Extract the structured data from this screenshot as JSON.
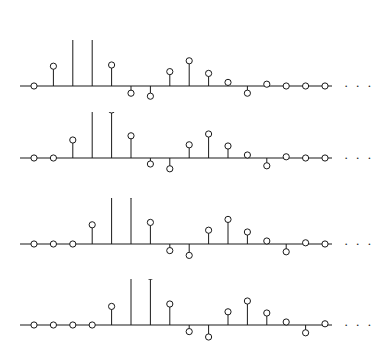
{
  "figure": {
    "title": "",
    "background_color": "#ffffff",
    "line_color": "#1a1a1a",
    "marker_fill": "#ffffff",
    "width": 375,
    "height": 361,
    "continuation_symbol": "· · ·"
  },
  "chart_data": {
    "type": "line",
    "subtype": "stem",
    "title": "",
    "xlabel": "",
    "ylabel": "",
    "grid": false,
    "legend": null,
    "axis": {
      "baseline_visible": true,
      "x_start_px": 20,
      "x_end_px": 332,
      "sample_spacing_px": 19.4,
      "first_sample_px": 34,
      "ticks_shown": false,
      "tick_labels": [],
      "y_tick_labels": []
    },
    "panel_layout": {
      "count": 4,
      "baselines_px": [
        86,
        158,
        244,
        325
      ],
      "unit_scale_px": 60,
      "annotation": "Four stacked stem (impulse) sequence plots, each continuing to the right with an ellipsis."
    },
    "panels": [
      {
        "name": "panel-1",
        "index": 0,
        "baseline_y_px": 86,
        "ellipsis_x_px": 344,
        "x": [
          0,
          1,
          2,
          3,
          4,
          5,
          6,
          7,
          8,
          9,
          10,
          11,
          12,
          13,
          14,
          15,
          16
        ],
        "values": [
          0.0,
          0.33,
          1.0,
          0.83,
          0.35,
          -0.12,
          -0.17,
          0.24,
          0.42,
          0.21,
          0.06,
          -0.12,
          0.03,
          0.0,
          0.0,
          0.0,
          0.0
        ]
      },
      {
        "name": "panel-2",
        "index": 1,
        "baseline_y_px": 158,
        "ellipsis_x_px": 344,
        "x": [
          0,
          1,
          2,
          3,
          4,
          5,
          6,
          7,
          8,
          9,
          10,
          11,
          12,
          13,
          14,
          15,
          16
        ],
        "values": [
          0.0,
          0.0,
          0.3,
          0.98,
          0.8,
          0.37,
          -0.1,
          -0.18,
          0.22,
          0.4,
          0.2,
          0.05,
          -0.13,
          0.02,
          0.0,
          0.0,
          0.0
        ]
      },
      {
        "name": "panel-3",
        "index": 2,
        "baseline_y_px": 244,
        "ellipsis_x_px": 344,
        "x": [
          0,
          1,
          2,
          3,
          4,
          5,
          6,
          7,
          8,
          9,
          10,
          11,
          12,
          13,
          14,
          15,
          16
        ],
        "values": [
          0.0,
          0.0,
          0.0,
          0.32,
          1.0,
          0.82,
          0.36,
          -0.11,
          -0.19,
          0.23,
          0.41,
          0.2,
          0.05,
          -0.13,
          0.02,
          0.0,
          0.0
        ]
      },
      {
        "name": "panel-4",
        "index": 3,
        "baseline_y_px": 325,
        "ellipsis_x_px": 344,
        "x": [
          0,
          1,
          2,
          3,
          4,
          5,
          6,
          7,
          8,
          9,
          10,
          11,
          12,
          13,
          14,
          15,
          16
        ],
        "values": [
          0.0,
          0.0,
          0.0,
          0.0,
          0.31,
          0.99,
          0.81,
          0.35,
          -0.11,
          -0.2,
          0.22,
          0.4,
          0.2,
          0.05,
          -0.13,
          0.02,
          0.0
        ]
      }
    ]
  }
}
